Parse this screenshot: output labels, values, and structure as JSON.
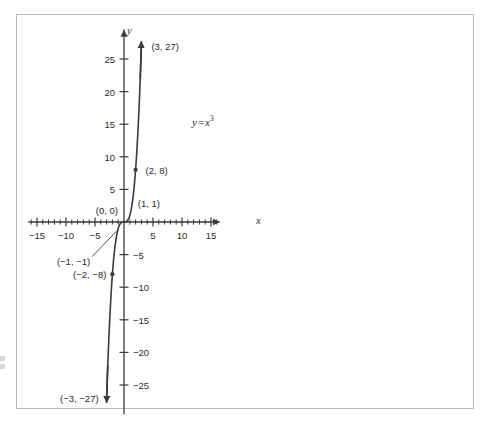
{
  "figure": {
    "frame_color": "#b9b9b9",
    "background": "#ffffff",
    "ink_color": "#3a3a3a"
  },
  "axes": {
    "x_name": "x",
    "y_name": "y"
  },
  "annotation": {
    "equation_lhs": "y",
    "equation_op": "=",
    "equation_base": "x",
    "equation_exp": "3",
    "equation_plain": "y = x3"
  },
  "chart_data": {
    "type": "line",
    "title": "",
    "subtitle": "",
    "xlabel": "x",
    "ylabel": "y",
    "annotations": [
      {
        "text": "y = x³",
        "x": 6.5,
        "y": 14.5
      }
    ],
    "grid": false,
    "legend": null,
    "xlim": [
      -16.5,
      16.5
    ],
    "ylim": [
      -29.5,
      29.5
    ],
    "x_major_ticks": [
      -15,
      -10,
      -5,
      5,
      10,
      15
    ],
    "x_minor_tick_step": 1,
    "x_tick_labels": [
      "−15",
      "−10",
      "−5",
      "5",
      "10",
      "15"
    ],
    "y_major_ticks": [
      -25,
      -20,
      -15,
      -10,
      -5,
      5,
      10,
      15,
      20,
      25
    ],
    "y_tick_labels": [
      "−25",
      "−20",
      "−15",
      "−10",
      "−5",
      "5",
      "10",
      "15",
      "20",
      "25"
    ],
    "series": [
      {
        "name": "y = x³",
        "color": "#3a3a3a",
        "x": [
          -3.0,
          -2.8,
          -2.6,
          -2.4,
          -2.2,
          -2.0,
          -1.8,
          -1.6,
          -1.4,
          -1.2,
          -1.0,
          -0.8,
          -0.6,
          -0.4,
          -0.2,
          0.0,
          0.2,
          0.4,
          0.6,
          0.8,
          1.0,
          1.2,
          1.4,
          1.6,
          1.8,
          2.0,
          2.2,
          2.4,
          2.6,
          2.8,
          3.0
        ],
        "y": [
          -27.0,
          -21.952,
          -17.576,
          -13.824,
          -10.648,
          -8.0,
          -5.832,
          -4.096,
          -2.744,
          -1.728,
          -1.0,
          -0.512,
          -0.216,
          -0.064,
          -0.008,
          0.0,
          0.008,
          0.064,
          0.216,
          0.512,
          1.0,
          1.728,
          2.744,
          4.096,
          5.832,
          8.0,
          10.648,
          13.824,
          17.576,
          21.952,
          27.0
        ],
        "arrow_start": true,
        "arrow_end": true
      }
    ],
    "marked_points": [
      {
        "label": "(3, 27)",
        "x": 3,
        "y": 27,
        "dot": false,
        "anchor": "start",
        "label_dx": 10,
        "label_dy": 0
      },
      {
        "label": "(2, 8)",
        "x": 2,
        "y": 8,
        "dot": true,
        "anchor": "start",
        "label_dx": 10,
        "label_dy": 0
      },
      {
        "label": "(1, 1)",
        "x": 1,
        "y": 1,
        "dot": false,
        "anchor": "start",
        "label_dx": 8,
        "label_dy": -12
      },
      {
        "label": "(0, 0)",
        "x": 0,
        "y": 0,
        "dot": false,
        "anchor": "end",
        "label_dx": -6,
        "label_dy": -12
      },
      {
        "label": "(−1, −1)",
        "x": -1,
        "y": -1,
        "dot": false,
        "anchor": "end",
        "label_dx": -28,
        "label_dy": 32,
        "leader": true
      },
      {
        "label": "(−2, −8)",
        "x": -2,
        "y": -8,
        "dot": true,
        "anchor": "end",
        "label_dx": -6,
        "label_dy": 0
      },
      {
        "label": "(−3, −27)",
        "x": -3,
        "y": -27,
        "dot": false,
        "anchor": "end",
        "label_dx": -8,
        "label_dy": 0
      }
    ]
  }
}
